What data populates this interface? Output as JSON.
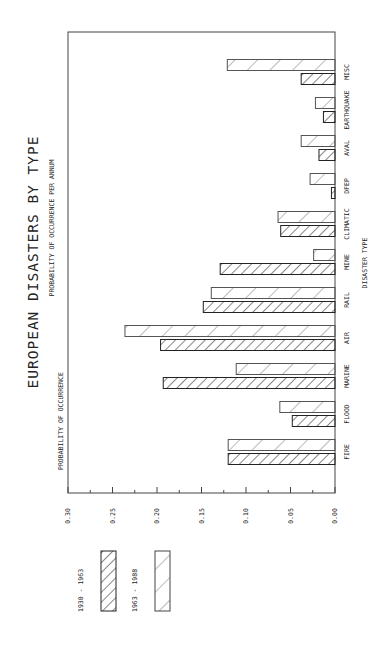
{
  "chart_data": {
    "type": "bar",
    "orientation": "rotated-90-ccw",
    "title": "EUROPEAN DISASTERS BY TYPE",
    "subtitle": "PROBABILITY OF OCCURRENCE PER ANNUM",
    "xlabel": "DISASTER TYPE",
    "ylabel": "PROBABILITY OF OCCURRENCE",
    "ylim": [
      0,
      0.3
    ],
    "yticks": [
      "0.00",
      "0.05",
      "0.10",
      "0.15",
      "0.20",
      "0.25",
      "0.30"
    ],
    "grid": false,
    "legend_position": "left (rotated, below chart)",
    "categories": [
      "FIRE",
      "FLOOD",
      "MARINE",
      "AIR",
      "RAIL",
      "MINE",
      "CLIMATIC",
      "DFEP",
      "AVAL",
      "EARTHQUAKE",
      "MISC"
    ],
    "series": [
      {
        "name": "1930 - 1963",
        "pattern": "dense-hatch",
        "values": [
          0.12,
          0.048,
          0.193,
          0.196,
          0.148,
          0.129,
          0.061,
          0.004,
          0.018,
          0.013,
          0.038
        ]
      },
      {
        "name": "1963 - 1988",
        "pattern": "sparse-hatch",
        "values": [
          0.12,
          0.062,
          0.111,
          0.236,
          0.139,
          0.024,
          0.064,
          0.028,
          0.038,
          0.022,
          0.121
        ]
      }
    ]
  },
  "colors": {
    "ink": "#222222",
    "background": "#ffffff"
  }
}
